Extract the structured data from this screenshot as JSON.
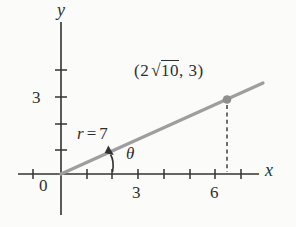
{
  "colors": {
    "background": "#fbfbf9",
    "ink": "#333333",
    "ray": "#9e9e9e",
    "point": "#8f8f8f"
  },
  "axes": {
    "x_label": "x",
    "y_label": "y",
    "origin_label": "0",
    "x_tick_labels": [
      "3",
      "6"
    ],
    "y_tick_labels": [
      "3"
    ]
  },
  "labels": {
    "radius": {
      "var": "r",
      "eq": "=",
      "value": "7"
    },
    "angle": "θ",
    "point": {
      "open": "(2",
      "radical": "√",
      "radicand": "10",
      "close": ", 3)"
    }
  }
}
